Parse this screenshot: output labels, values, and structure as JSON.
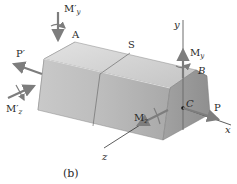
{
  "figure": {
    "caption": "(b)",
    "labels": {
      "A": "A",
      "S": "S",
      "B": "B",
      "C": "C",
      "y_axis": "y",
      "x_axis": "x",
      "z_axis": "z",
      "P": "P",
      "P_prime": "P′",
      "M_y_prime_main": "M′",
      "M_y_prime_sub": "y",
      "M_z_prime_main": "M′",
      "M_z_prime_sub": "z",
      "M_y_main": "M",
      "M_y_sub": "y",
      "M_z_main": "M",
      "M_z_sub": "z"
    },
    "colors": {
      "arrow": "#7d7d7d",
      "axis": "#333333",
      "face_light": "#d6d6d6",
      "face_mid": "#bdbdbd",
      "face_dark": "#9e9e9e"
    }
  }
}
